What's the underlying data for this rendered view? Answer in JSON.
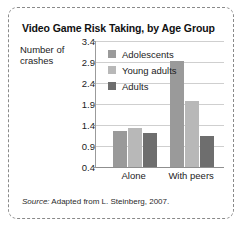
{
  "figure": {
    "title": "Video Game Risk Taking, by Age Group",
    "axis_title_line1": "Number of",
    "axis_title_line2": "crashes",
    "source_label": "Source:",
    "source_text": "Adapted from L. Steinberg, 2007."
  },
  "colors": {
    "adolescents": "#9a9a9a",
    "young_adults": "#b8b8b8",
    "adults": "#6e6e6e",
    "gridline": "#cfcfcf",
    "axis": "#9b9b9b",
    "border": "#8a8a8a",
    "background": "#ffffff",
    "text": "#1c1c1c"
  },
  "chart_data": {
    "type": "bar",
    "title": "Video Game Risk Taking, by Age Group",
    "xlabel": "",
    "ylabel": "Number of crashes",
    "categories": [
      "Alone",
      "With peers"
    ],
    "yticks": [
      0.4,
      0.9,
      1.4,
      1.9,
      2.4,
      2.9,
      3.4
    ],
    "ytick_labels": [
      "0.4",
      "0.9",
      "1.4",
      "1.9",
      "2.4",
      "2.9",
      "3.4"
    ],
    "ylim": [
      0.4,
      3.4
    ],
    "grid": true,
    "legend_position": "upper left inside",
    "series": [
      {
        "name": "Adolescents",
        "color": "#9a9a9a",
        "values": [
          1.25,
          2.92
        ]
      },
      {
        "name": "Young adults",
        "color": "#b8b8b8",
        "values": [
          1.32,
          1.97
        ]
      },
      {
        "name": "Adults",
        "color": "#6e6e6e",
        "values": [
          1.22,
          1.15
        ]
      }
    ],
    "source": "Source: Adapted from L. Steinberg, 2007."
  }
}
